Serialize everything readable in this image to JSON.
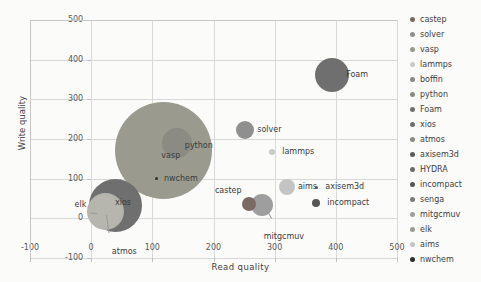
{
  "chart_data": {
    "type": "scatter",
    "title": "",
    "xlabel": "Read  quality",
    "ylabel": "Write quality",
    "xlim": [
      -100,
      500
    ],
    "ylim": [
      -100,
      500
    ],
    "xticks": [
      "-100",
      "0",
      "100",
      "200",
      "300",
      "400",
      "500"
    ],
    "yticks": [
      "500",
      "400",
      "300",
      "200",
      "100",
      "0",
      "-100"
    ],
    "grid": true,
    "legend_position": "right",
    "note": "Bubble chart: x = Read quality, y = Write quality, bubble area = third value",
    "points": [
      {
        "name": "castep",
        "x": 258,
        "y": 35,
        "size": 14,
        "color": "#7b6a63",
        "label": "castep",
        "label_dx": -34,
        "label_dy": -13
      },
      {
        "name": "solver",
        "x": 252,
        "y": 222,
        "size": 18,
        "color": "#8f8f8f",
        "label": "solver",
        "label_dx": 12,
        "label_dy": 0
      },
      {
        "name": "vasp",
        "x": 118,
        "y": 172,
        "size": 97,
        "color": "#9a9a8e",
        "label": "vasp",
        "label_dx": -2,
        "label_dy": 6
      },
      {
        "name": "lammps",
        "x": 296,
        "y": 168,
        "size": 6,
        "color": "#c9c9c9",
        "label": "lammps",
        "label_dx": 10,
        "label_dy": 0
      },
      {
        "name": "boffin",
        "x": 0,
        "y": 0,
        "size": 0,
        "color": "#8a8a8a",
        "label": "",
        "label_dx": 0,
        "label_dy": 0
      },
      {
        "name": "python",
        "x": 140,
        "y": 190,
        "size": 30,
        "color": "#8b8b84",
        "label": "python",
        "label_dx": 8,
        "label_dy": 3
      },
      {
        "name": "Foam",
        "x": 394,
        "y": 362,
        "size": 34,
        "color": "#6f6f6f",
        "label": "Foam",
        "label_dx": 14,
        "label_dy": 0
      },
      {
        "name": "xios",
        "x": 39,
        "y": 33,
        "size": 53,
        "color": "#6f6f6f",
        "label": "xios",
        "label_dx": 0,
        "label_dy": -2
      },
      {
        "name": "atmos",
        "x": 24,
        "y": 17,
        "size": 37,
        "color": "#b3b3ad",
        "label": "atmos",
        "label_dx": 6,
        "label_dy": 40
      },
      {
        "name": "axisem3d",
        "x": 368,
        "y": 78,
        "size": 3,
        "color": "#5c5c5c",
        "label": "axisem3d",
        "label_dx": 9,
        "label_dy": 0
      },
      {
        "name": "HYDRA",
        "x": 0,
        "y": 0,
        "size": 0,
        "color": "#6b6b6b",
        "label": "",
        "label_dx": 0,
        "label_dy": 0
      },
      {
        "name": "incompact",
        "x": 368,
        "y": 38,
        "size": 8,
        "color": "#575757",
        "label": "incompact",
        "label_dx": 11,
        "label_dy": 0
      },
      {
        "name": "senga",
        "x": 0,
        "y": 0,
        "size": 0,
        "color": "#7a7a7a",
        "label": "",
        "label_dx": 0,
        "label_dy": 0
      },
      {
        "name": "mitgcmuv",
        "x": 279,
        "y": 33,
        "size": 22,
        "color": "#9e9e9e",
        "label": "mitgcmuv",
        "label_dx": 2,
        "label_dy": 32
      },
      {
        "name": "elk",
        "x": 22,
        "y": 17,
        "size": 34,
        "color": "#b6b6ae",
        "label": "elk",
        "label_dx": -30,
        "label_dy": -7
      },
      {
        "name": "aims",
        "x": 320,
        "y": 78,
        "size": 16,
        "color": "#c4c4c4",
        "label": "aims",
        "label_dx": 11,
        "label_dy": 0
      },
      {
        "name": "nwchem",
        "x": 106,
        "y": 100,
        "size": 3,
        "color": "#2f2f2f",
        "label": "nwchem",
        "label_dx": 8,
        "label_dy": 0
      }
    ]
  },
  "legend": {
    "items": [
      {
        "label": "castep",
        "color": "#7b6a63"
      },
      {
        "label": "solver",
        "color": "#8f8f8f"
      },
      {
        "label": "vasp",
        "color": "#9a9a8e"
      },
      {
        "label": "lammps",
        "color": "#c9c9c9"
      },
      {
        "label": "boffin",
        "color": "#8a8a8a"
      },
      {
        "label": "python",
        "color": "#8b8b84"
      },
      {
        "label": "Foam",
        "color": "#6f6f6f"
      },
      {
        "label": "xios",
        "color": "#6f6f6f"
      },
      {
        "label": "atmos",
        "color": "#8a8a82"
      },
      {
        "label": "axisem3d",
        "color": "#5c5c5c"
      },
      {
        "label": "HYDRA",
        "color": "#6b6b6b"
      },
      {
        "label": "incompact",
        "color": "#575757"
      },
      {
        "label": "senga",
        "color": "#7a7a7a"
      },
      {
        "label": "mitgcmuv",
        "color": "#9e9e9e"
      },
      {
        "label": "elk",
        "color": "#9c9c94"
      },
      {
        "label": "aims",
        "color": "#c4c4c4"
      },
      {
        "label": "nwchem",
        "color": "#2f2f2f"
      }
    ]
  }
}
